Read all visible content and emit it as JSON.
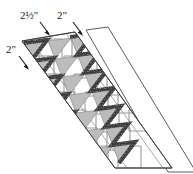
{
  "figure": {
    "background_color": "#ffffff"
  },
  "labels": [
    {
      "id": "label-strip-width",
      "text": "2½\"",
      "whole": "2",
      "fraction": "½",
      "unit": "\"",
      "x": 20,
      "y": 19,
      "arrow": {
        "x1": 40,
        "y1": 22,
        "x2": 50,
        "y2": 36
      }
    },
    {
      "id": "label-square-size",
      "text": "2\"",
      "whole": "2",
      "fraction": "",
      "unit": "\"",
      "x": 57,
      "y": 19,
      "arrow": {
        "x1": 73,
        "y1": 22,
        "x2": 83,
        "y2": 36
      }
    },
    {
      "id": "label-seam-allowance",
      "text": "2\"",
      "whole": "2",
      "fraction": "",
      "unit": "\"",
      "x": 6,
      "y": 53,
      "arrow": {
        "x1": 19,
        "y1": 56,
        "x2": 29,
        "y2": 70
      }
    }
  ],
  "colors": {
    "outline": "#3a3a3a",
    "strip_outline": "#4a4a4a",
    "shaded_triangle": "#b8b8b8",
    "square_outline": "#9a9a9a",
    "dark_seam": "#3c3c3c",
    "dark_seam_alt": "#595959",
    "label_text": "#1a1a1a",
    "background": "#ffffff"
  },
  "geometry": {
    "strip_count": 2,
    "strip_width_label": "2½\"",
    "square_size_label": "2\"",
    "zigzag_units": 9,
    "direction": "diagonal down-right"
  }
}
